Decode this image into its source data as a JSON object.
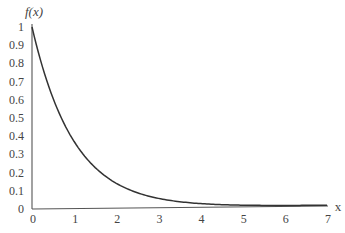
{
  "chart_data": {
    "type": "line",
    "title": "",
    "xlabel": "x",
    "ylabel": "f(x)",
    "xlim": [
      0,
      7
    ],
    "ylim": [
      0,
      1
    ],
    "grid": false,
    "legend": null,
    "x_ticks": [
      "0",
      "1",
      "2",
      "3",
      "4",
      "5",
      "6",
      "7"
    ],
    "y_ticks": [
      "0",
      "0.1",
      "0.2",
      "0.3",
      "0.4",
      "0.5",
      "0.6",
      "0.7",
      "0.8",
      "0.9",
      "1"
    ],
    "series": [
      {
        "name": "f(x) = e^(-x)",
        "x": [
          0,
          0.25,
          0.5,
          0.75,
          1,
          1.5,
          2,
          2.5,
          3,
          3.5,
          4,
          4.5,
          5,
          5.5,
          6,
          6.5,
          7
        ],
        "values": [
          1.0,
          0.78,
          0.61,
          0.47,
          0.37,
          0.22,
          0.14,
          0.08,
          0.05,
          0.03,
          0.02,
          0.01,
          0.01,
          0.0,
          0.0,
          0.0,
          0.0
        ],
        "color": "#333333"
      }
    ]
  },
  "colors": {
    "axis": "#555555",
    "curve": "#333333",
    "text": "#444444"
  }
}
